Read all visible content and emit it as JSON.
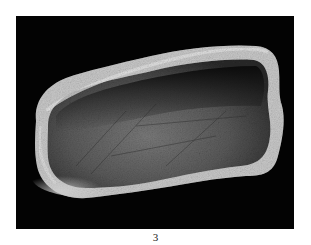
{
  "figure": {
    "caption": "3",
    "background_color": "#030303",
    "object_highlight_color": "#d8d8d8",
    "object_mid_color": "#6e6e6e",
    "object_shadow_color": "#1a1a1a"
  }
}
